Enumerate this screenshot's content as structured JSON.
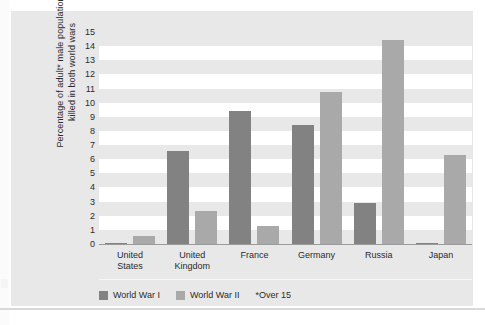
{
  "figure": {
    "page_marker": "4"
  },
  "chart_data": {
    "type": "bar",
    "title": "",
    "xlabel": "",
    "ylabel": "Percentage of adult* male population\nkilled in both world wars",
    "ylim": [
      0,
      15
    ],
    "yticks": [
      0,
      1,
      2,
      3,
      4,
      5,
      6,
      7,
      8,
      9,
      10,
      11,
      12,
      13,
      14,
      15
    ],
    "ytick_labels": [
      "0",
      "1",
      "2",
      "3",
      "4",
      "5",
      "6",
      "7",
      "8",
      "9",
      "10",
      "11",
      "12",
      "13",
      "14",
      "15"
    ],
    "grid": "alternating-horizontal-bands",
    "legend_position": "bottom-left",
    "categories": [
      "United States",
      "United Kingdom",
      "France",
      "Germany",
      "Russia",
      "Japan"
    ],
    "category_labels": [
      "United\nStates",
      "United\nKingdom",
      "France",
      "Germany",
      "Russia",
      "Japan"
    ],
    "series": [
      {
        "name": "World War I",
        "color": "#828282",
        "values": [
          0.1,
          6.6,
          9.4,
          8.4,
          2.9,
          0.05
        ]
      },
      {
        "name": "World War II",
        "color": "#a9a9a9",
        "values": [
          0.55,
          2.35,
          1.3,
          10.75,
          14.4,
          6.3
        ]
      }
    ],
    "annotations": [
      "*Over 15"
    ]
  },
  "legend": {
    "items": [
      {
        "label": "World War I",
        "color": "#828282"
      },
      {
        "label": "World War II",
        "color": "#a9a9a9"
      }
    ],
    "note": "*Over 15"
  }
}
